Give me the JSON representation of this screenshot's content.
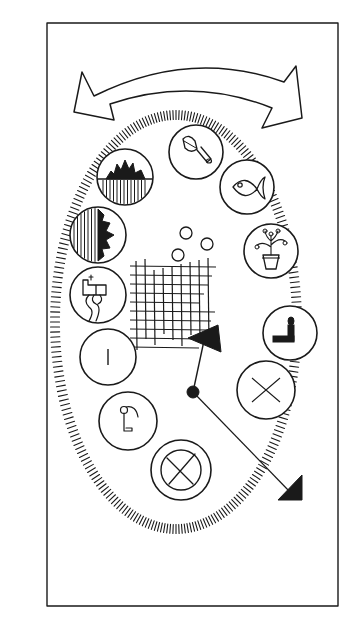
{
  "canvas": {
    "width": 352,
    "height": 626,
    "background": "#ffffff",
    "ink": "#1a1a1a"
  },
  "frame": {
    "x": 47,
    "y": 23,
    "width": 291,
    "height": 583
  },
  "double_arrow": {
    "description": "curved double-headed arrow above the oval",
    "outer_path": "M 108 112 L 82 72 L 74 112 L 95 95 Q 190 48 286 83 L 300 118 L 270 128 Q 193 86 113 103 Z",
    "inner_path": "M 95 95 Q 190 48 286 83"
  },
  "oval": {
    "description": "hatched oval ring of short tick marks",
    "cx": 176,
    "cy": 322,
    "rx": 121,
    "ry": 207,
    "tick_count": 260,
    "tick_length": 9
  },
  "medallions": [
    {
      "name": "chisel",
      "cx": 196,
      "cy": 152,
      "r": 27,
      "filled": false
    },
    {
      "name": "fish",
      "cx": 247,
      "cy": 187,
      "r": 27,
      "filled": false
    },
    {
      "name": "sun-over-water",
      "cx": 125,
      "cy": 177,
      "r": 28,
      "filled": false
    },
    {
      "name": "sun-beside-water",
      "cx": 98,
      "cy": 235,
      "r": 28,
      "filled": false
    },
    {
      "name": "potted-plant",
      "cx": 271,
      "cy": 251,
      "r": 27,
      "filled": false
    },
    {
      "name": "faucet-pipe",
      "cx": 98,
      "cy": 295,
      "r": 28,
      "filled": false
    },
    {
      "name": "seated-figure",
      "cx": 290,
      "cy": 333,
      "r": 27,
      "filled": false
    },
    {
      "name": "open-book",
      "cx": 108,
      "cy": 357,
      "r": 28,
      "filled": true
    },
    {
      "name": "envelope",
      "cx": 266,
      "cy": 390,
      "r": 29,
      "filled": true
    },
    {
      "name": "key-hook",
      "cx": 128,
      "cy": 421,
      "r": 29,
      "filled": false
    },
    {
      "name": "crossed-circle",
      "cx": 181,
      "cy": 470,
      "r": 30,
      "filled": false,
      "inner_r": 20
    }
  ],
  "bubbles": [
    {
      "cx": 186,
      "cy": 233,
      "r": 6
    },
    {
      "cx": 207,
      "cy": 244,
      "r": 6
    },
    {
      "cx": 178,
      "cy": 255,
      "r": 6
    }
  ],
  "grid": {
    "description": "hand-drawn cross-hatched grid",
    "x0": 136,
    "y0": 262,
    "x1": 212,
    "y1": 350,
    "step": 9
  },
  "pointer": {
    "hub": {
      "cx": 193,
      "cy": 392,
      "r": 6
    },
    "short_hand_tip": {
      "x": 205,
      "y": 336
    },
    "short_hand_head": "M 188 338 L 218 325 L 221 352 Z",
    "long_hand_tip": {
      "x": 290,
      "y": 492
    },
    "long_hand_head": "M 278 500 L 302 475 L 302 500 Z"
  }
}
